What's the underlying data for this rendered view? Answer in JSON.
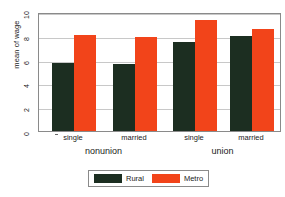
{
  "chart_data": {
    "type": "bar",
    "title": "",
    "xlabel": "",
    "ylabel": "mean of wage",
    "ylim": [
      0,
      10
    ],
    "yticks": [
      0,
      2,
      4,
      6,
      8,
      10
    ],
    "ytick_labels": [
      "0",
      "2",
      "4",
      "6",
      "8",
      "10"
    ],
    "grid": true,
    "grid_axis": "y",
    "legend_position": "bottom-center",
    "group_labels": [
      "nonunion",
      "union"
    ],
    "categories": [
      "single",
      "married",
      "single",
      "married"
    ],
    "category_groups": [
      "nonunion",
      "nonunion",
      "union",
      "union"
    ],
    "series": [
      {
        "name": "Rural",
        "color": "#1c2e21",
        "values": [
          5.7,
          5.6,
          7.5,
          8.0
        ]
      },
      {
        "name": "Metro",
        "color": "#f2441a",
        "values": [
          8.1,
          7.9,
          9.3,
          8.6
        ]
      }
    ]
  },
  "legend": {
    "entries": [
      {
        "label": "Rural",
        "color": "#1c2e21"
      },
      {
        "label": "Metro",
        "color": "#f2441a"
      }
    ]
  },
  "axis": {
    "y_title": "mean of wage"
  },
  "colors": {
    "rural": "#1c2e21",
    "metro": "#f2441a",
    "gridline": "#c8c8c8",
    "frame": "#8a8a8a",
    "background": "#ffffff",
    "text": "#1a1a1a"
  }
}
